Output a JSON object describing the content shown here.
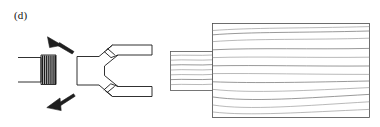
{
  "figure": {
    "panel_label": "(d)",
    "caption": "",
    "background_color": "#ffffff",
    "line_color": "#1a1a1a",
    "grain_color": "#8e8e8e",
    "width": 380,
    "height": 127
  },
  "parts": {
    "threaded_rod": {
      "name": "threaded rod",
      "shank_x": 18,
      "shank_y": 57,
      "shank_w": 22,
      "shank_h": 25,
      "thread_x": 40,
      "thread_y": 55,
      "thread_w": 16,
      "thread_h": 29,
      "thread_count": 8
    },
    "clevis_fork": {
      "name": "clevis fork bracket",
      "body_x": 77,
      "body_y": 56,
      "body_w": 22,
      "body_h": 29,
      "arm_top_y": 40,
      "arm_bottom_y": 85,
      "arm_right_x": 152,
      "arm_thickness": 10
    },
    "tenon": {
      "name": "tenon",
      "x": 170,
      "y": 51,
      "w": 43,
      "h": 39,
      "grain_count": 7
    },
    "timber_block": {
      "name": "timber block with grain",
      "x": 212,
      "y": 23,
      "w": 158,
      "h": 95,
      "grain_count": 11
    },
    "pointer_top": {
      "name": "screw pointer upper",
      "tip_x": 48,
      "tip_y": 38,
      "head_x": 72,
      "head_y": 48
    },
    "pointer_bottom": {
      "name": "screw pointer lower",
      "tip_x": 48,
      "tip_y": 108,
      "head_x": 73,
      "head_y": 96
    }
  }
}
